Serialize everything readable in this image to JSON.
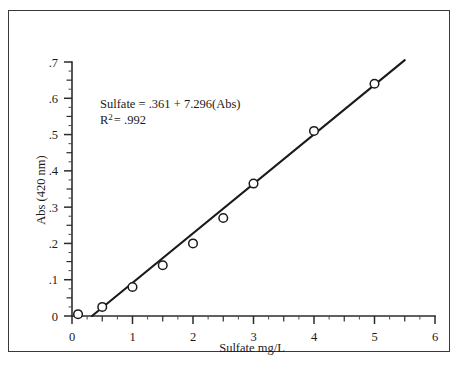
{
  "figure": {
    "frame_border_color": "#3a3a3a",
    "background_color": "#ffffff",
    "ink_color": "#1a1a1a"
  },
  "annotation": {
    "equation": "Sulfate = .361 + 7.296(Abs)",
    "r2_prefix": "R",
    "r2_exponent": "2",
    "r2_value": "= .992"
  },
  "chart_data": {
    "type": "scatter",
    "title": "",
    "subtitle": "",
    "xlabel": "Sulfate mg/L",
    "ylabel": "Abs (420 nm)",
    "xlim": [
      0,
      6
    ],
    "ylim": [
      0,
      0.7
    ],
    "grid": false,
    "legend": "none",
    "x_tick_labels": [
      "0",
      "1",
      "2",
      "3",
      "4",
      "5",
      "6"
    ],
    "x_tick_values": [
      0,
      1,
      2,
      3,
      4,
      5,
      6
    ],
    "x_minor_step": 0.25,
    "y_tick_labels": [
      "0",
      ".1",
      ".2",
      ".3",
      ".4",
      ".5",
      ".6",
      ".7"
    ],
    "y_tick_values": [
      0,
      0.1,
      0.2,
      0.3,
      0.4,
      0.5,
      0.6,
      0.7
    ],
    "y_minor_step": 0.025,
    "series": [
      {
        "name": "Sulfate standards",
        "marker": "open-circle",
        "x": [
          0.1,
          0.5,
          1.0,
          1.5,
          2.0,
          2.5,
          3.0,
          4.0,
          5.0
        ],
        "y": [
          0.005,
          0.025,
          0.08,
          0.14,
          0.2,
          0.27,
          0.365,
          0.51,
          0.64
        ]
      }
    ],
    "fit_line": {
      "name": "least-squares fit",
      "equation_label": "Sulfate = .361 + 7.296(Abs)",
      "r_squared": 0.992,
      "x_start": 0.33,
      "y_start": 0.0,
      "x_end": 5.5,
      "y_end": 0.705
    },
    "annotations": [
      {
        "text": "Sulfate = .361 + 7.296(Abs)",
        "x": 0.55,
        "y": 0.565
      },
      {
        "text": "R 2 = .992",
        "x": 0.55,
        "y": 0.525
      }
    ]
  }
}
